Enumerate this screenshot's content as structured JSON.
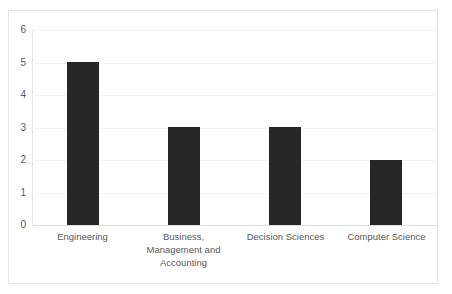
{
  "chart_data": {
    "type": "bar",
    "title": "",
    "subtitle": "",
    "xlabel": "",
    "ylabel": "",
    "categories": [
      "Engineering",
      "Business, Management and Accounting",
      "Decision Sciences",
      "Computer Science"
    ],
    "category_lines": [
      [
        "Engineering"
      ],
      [
        "Business,",
        "Management and",
        "Accounting"
      ],
      [
        "Decision Sciences"
      ],
      [
        "Computer Science"
      ]
    ],
    "values": [
      5,
      3,
      3,
      2
    ],
    "ylim": [
      0,
      6
    ],
    "ytick_labels": [
      "0",
      "1",
      "2",
      "3",
      "4",
      "5",
      "6"
    ],
    "ytick_values": [
      0,
      1,
      2,
      3,
      4,
      5,
      6
    ],
    "grid": true,
    "legend": false,
    "legend_position": "none",
    "bar_color": "#262626",
    "gridline_color": "#f2f2f2",
    "axis_color": "#e4e4e4",
    "background_color": "#ffffff",
    "tick_label_color": "#595959"
  }
}
